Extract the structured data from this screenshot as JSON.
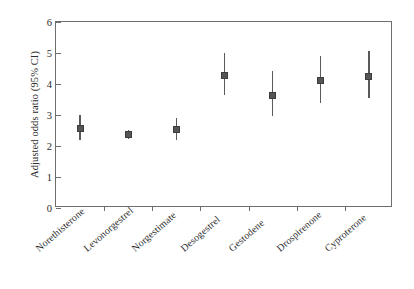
{
  "chart_data": {
    "type": "scatter",
    "title": "",
    "subtitle": "",
    "xlabel": "",
    "ylabel": "Adjusted odds ratio (95% CI)",
    "categories": [
      "Norethisterone",
      "Levonorgestrel",
      "Norgestimate",
      "Desogestrel",
      "Gestodene",
      "Drospirenone",
      "Cyproterone"
    ],
    "values": [
      2.55,
      2.38,
      2.53,
      4.28,
      3.62,
      4.1,
      4.25
    ],
    "ci_lower": [
      2.18,
      2.24,
      2.19,
      3.65,
      2.98,
      3.4,
      3.55
    ],
    "ci_upper": [
      3.01,
      2.52,
      2.9,
      4.99,
      4.41,
      4.91,
      5.06
    ],
    "ylim": [
      0,
      6
    ],
    "yticks": [
      0,
      1,
      2,
      3,
      4,
      5,
      6
    ],
    "ytick_labels": [
      "0",
      "1",
      "2",
      "3",
      "4",
      "5",
      "6"
    ],
    "grid": false,
    "legend": false,
    "legend_position": "none",
    "marker_color": "#555555",
    "whisker_color": "#5a5a5a",
    "axis_color": "#6e6e6e",
    "background_color": "#ffffff",
    "series": [
      {
        "name": "Adjusted odds ratio",
        "points": [
          {
            "category": "Norethisterone",
            "value": 2.55,
            "ci_lower": 2.18,
            "ci_upper": 3.01
          },
          {
            "category": "Levonorgestrel",
            "value": 2.38,
            "ci_lower": 2.24,
            "ci_upper": 2.52
          },
          {
            "category": "Norgestimate",
            "value": 2.53,
            "ci_lower": 2.19,
            "ci_upper": 2.9
          },
          {
            "category": "Desogestrel",
            "value": 4.28,
            "ci_lower": 3.65,
            "ci_upper": 4.99
          },
          {
            "category": "Gestodene",
            "value": 3.62,
            "ci_lower": 2.98,
            "ci_upper": 4.41
          },
          {
            "category": "Drospirenone",
            "value": 4.1,
            "ci_lower": 3.4,
            "ci_upper": 4.91
          },
          {
            "category": "Cyproterone",
            "value": 4.25,
            "ci_lower": 3.55,
            "ci_upper": 5.06
          }
        ]
      }
    ]
  }
}
